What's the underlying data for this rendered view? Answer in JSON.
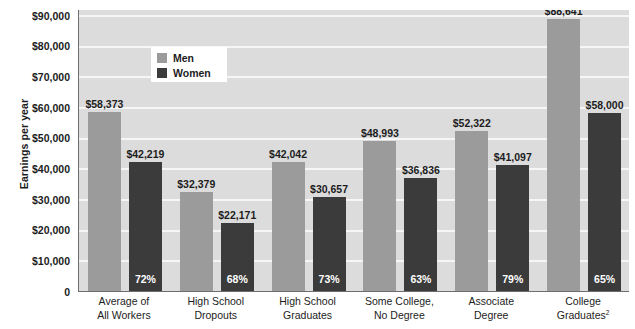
{
  "chart_data": {
    "type": "bar",
    "title": "",
    "xlabel": "",
    "ylabel": "Earnings per year",
    "ylim": [
      0,
      92000
    ],
    "grid": true,
    "legend_position": "inside-top-left",
    "categories": [
      "Average of\nAll Workers",
      "High School\nDropouts",
      "High School\nGraduates",
      "Some College,\nNo Degree",
      "Associate\nDegree",
      "College\nGraduates2"
    ],
    "category_lines": [
      [
        "Average of",
        "All Workers"
      ],
      [
        "High School",
        "Dropouts"
      ],
      [
        "High School",
        "Graduates"
      ],
      [
        "Some College,",
        "No Degree"
      ],
      [
        "Associate",
        "Degree"
      ],
      [
        "College",
        "Graduates"
      ]
    ],
    "category_footnote_index": 5,
    "category_footnote": "2",
    "series": [
      {
        "name": "Men",
        "color": "#9b9b9b",
        "values": [
          58373,
          32379,
          42042,
          48993,
          52322,
          88641
        ],
        "labels": [
          "$58,373",
          "$32,379",
          "$42,042",
          "$48,993",
          "$52,322",
          "$88,641"
        ]
      },
      {
        "name": "Women",
        "color": "#3b3b3b",
        "values": [
          42219,
          22171,
          30657,
          36836,
          41097,
          58000
        ],
        "labels": [
          "$42,219",
          "$22,171",
          "$30,657",
          "$36,836",
          "$41,097",
          "$58,000"
        ],
        "ratio_labels": [
          "72%",
          "68%",
          "73%",
          "63%",
          "79%",
          "65%"
        ]
      }
    ],
    "y_ticks": [
      0,
      10000,
      20000,
      30000,
      40000,
      50000,
      60000,
      70000,
      80000,
      90000
    ],
    "y_tick_labels": [
      "0",
      "$10,000",
      "$20,000",
      "$30,000",
      "$40,000",
      "$50,000",
      "$60,000",
      "$70,000",
      "$80,000",
      "$90,000"
    ]
  },
  "legend": {
    "items": [
      {
        "label": "Men",
        "color": "#9b9b9b"
      },
      {
        "label": "Women",
        "color": "#3b3b3b"
      }
    ]
  },
  "colors": {
    "plot_background": "#dcdcdc",
    "gridline": "#f6f6f6",
    "axis_line": "#6e6e6e",
    "men_bar": "#9b9b9b",
    "women_bar": "#3b3b3b",
    "text": "#1c1c1c",
    "pct_text": "#ffffff",
    "legend_background": "#ffffff",
    "page_background": "#ffffff"
  }
}
